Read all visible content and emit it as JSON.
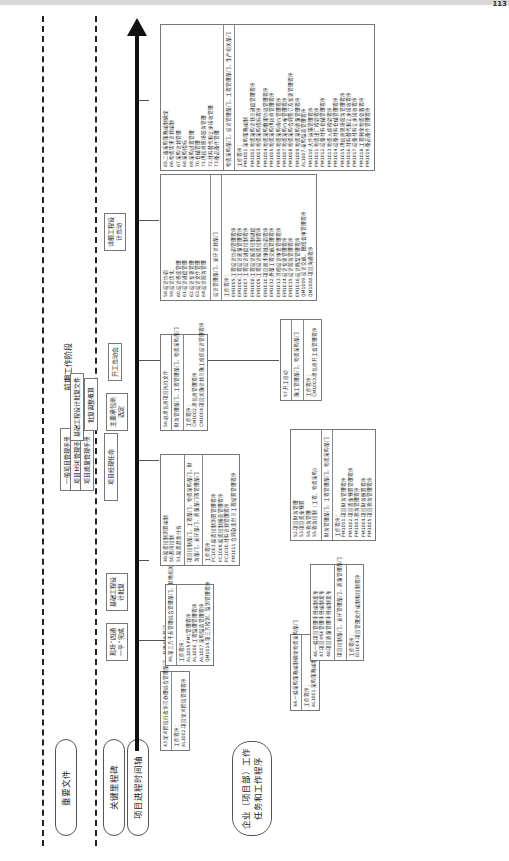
{
  "page_number": "113",
  "phase_label": "前期工作阶段",
  "swimlanes": [
    {
      "label": "重要文件"
    },
    {
      "label": "关键里程碑"
    },
    {
      "label": "项目进程时间轴"
    },
    {
      "label": "企业（项目部）工作任务和工作程序"
    }
  ],
  "milestones": [
    {
      "label": "项目经理任命"
    },
    {
      "label": "现场“四通一平”完成"
    },
    {
      "label": "基础工程设计批复"
    },
    {
      "label": "主要承包商选定"
    },
    {
      "label": "开工启动会"
    },
    {
      "label": "详细工程设计启动"
    }
  ],
  "documents": [
    {
      "label": "一般项目管理手册"
    },
    {
      "label": "项目HSE管理手册"
    },
    {
      "label": "项目质量管理手册"
    },
    {
      "label": "基础工程设计批复文件"
    },
    {
      "label": "批复调整概算"
    }
  ],
  "task_boxes": [
    {
      "tasks": [
        "43.定义阶段行政许可办理综合管理部门，其他相关部门"
      ],
      "depts": "",
      "procedures": [
        "工作程序：",
        "AL1002.项目定义阶段管理程序"
      ]
    },
    {
      "tasks": [
        "44.一般采购策略编制确定物资采购部门"
      ],
      "depts": "",
      "procedures": [
        "工作程序：",
        "AL1001.采购策略编制管理程序"
      ]
    },
    {
      "tasks": [
        "45.第三方干系管理综合管理部门，其他相关部门"
      ],
      "depts": "",
      "procedures": [
        "工作程序：",
        "AL1005.PMC管理程序",
        "AL1006.工程监理管理程序",
        "AL1007.采购监造管理程序",
        "QM1014.第三方检测、监测管理程序"
      ]
    },
    {
      "tasks": [
        "46.一般项目管理手册编制发布",
        "47.项目HSE管理手册编制发布",
        "48.项目质量管理手册编制发布"
      ],
      "depts": "项目控制部门，安环管理部门，质量管理部门",
      "procedures": [
        "工作程序：",
        "ID1004.项目管理文件编制和控制程序"
      ]
    },
    {
      "tasks": [
        "49.投资控制测算编制",
        "50.费用控制",
        "51.投资趋势分析"
      ],
      "depts": "项目控制部门，工程部门，物资采购部门，财务部门，安环部门，质量部门等管理部门",
      "procedures": [
        "工作程序：",
        "PC1003.投资控制测算管理程序",
        "PC1009.投资控制报告管理程序",
        "PC1010.材料计划管理程序",
        "PM1011.合同款支付与工程结算管理程序"
      ]
    },
    {
      "tasks": [
        "52.项目财务管理",
        "53.项目资金预算",
        "54.税务管理",
        "55.税务控制（工程、物资采购）"
      ],
      "depts": "财务管理部门，工程管理部门，物资采购部门",
      "procedures": [
        "工作程序：",
        "PM1001.项目财务管理程序",
        "PM1002.项目资金预算管理程序",
        "PM1003.税务管理程序",
        "PM1004.项目财务核算程序",
        "PM1005.项目税务管理程序"
      ]
    },
    {
      "tasks": [
        "56.总承包商项目执行文件"
      ],
      "depts": "财务管理部门，工程管理部门，物资采购部门",
      "procedures": [
        "工作程序：",
        "CM1002.承包商管理程序",
        "CM1004.项目实施计划与施工组织设计管理程序"
      ]
    },
    {
      "tasks": [
        "57.开工启动"
      ],
      "depts": "施工管理部门，物资采购部门",
      "procedures": [
        "工作程序：",
        "CM1003.承包商开工会管理程序"
      ]
    },
    {
      "tasks": [
        "58.设计协调",
        "59.设计优化",
        "60.设计界面管理",
        "61.设计进度管理",
        "62.设计变更管理",
        "63.设计文件管理",
        "64.设计服务管理"
      ],
      "depts": "设计管理部门，安环计划部门",
      "procedures": [
        "工作程序：",
        "EM1005.工程设计协调管理程序",
        "EM1006.工程设计质量管理程序",
        "EM1007.工程设计进度控制程序",
        "EM1008.工程设计投资控制进度",
        "EM1009.工程设计投资控制程序",
        "EM1010.项目技术审批协调程序",
        "EM1012.外部工程交底管理程序",
        "EM1013.详细设计审查管理程序",
        "EM1014.设计变更管理程序",
        "EM1015.设计服务管理程序",
        "EM1016.设计档案管理程序",
        "QM1009.设计交底、图纸会审管理程序",
        "QM1008.项目沟通程序"
      ]
    },
    {
      "tasks": [
        "65.二级采购策略编制确定",
        "66.物资需求计划编制",
        "67.采购计划管理",
        "68.采购招标",
        "69.采购过程管理",
        "70.仓储管理",
        "71.供应商现场服务管理",
        "72.材料替代和让步接收管理",
        "73.备品备件管理"
      ],
      "depts": "物资采购部门，设计管理部门，工程管理部门，生产相关部门",
      "procedures": [
        "工作程序：",
        "PM1001.采购策略编制",
        "PM1002.物资采购计划与进度管理程序",
        "PM1003.物资采购招标程序",
        "PM1004.物资采购框架协议管理程序",
        "PM1005.物资采购供应商管理程序",
        "PM1006.物资采购询价管理程序",
        "PM1007.物资采购价格管理程序",
        "PM1008.物资采购合同签订及变更管理程序",
        "PM1009.物资采购质量管理程序",
        "AL1007.采购监造管理程序",
        "PM1010.大件运输管理程序",
        "PM1011.物资出厂检验程序",
        "PM1012.设备材料仓储管理程序",
        "PM1013.物资入库检验程序",
        "PM1014.设备材料仓储管理程序",
        "PM1015.供应商现场服务管理程序",
        "PM1016.材料替代和让步接收程序",
        "PM1017.设备材料让步接收程序",
        "PM1018.工程剩余物资处置程序",
        "PM1019.备品备件管理程序"
      ]
    }
  ]
}
